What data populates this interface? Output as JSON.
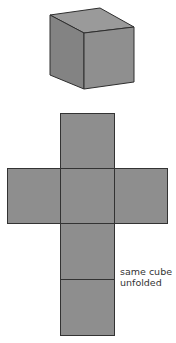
{
  "diagram": {
    "cube": {
      "label": "cube",
      "face_color": "#8e8e8e",
      "top_color": "#9a9a9a",
      "side_color": "#838383",
      "edge_color": "#2e2e2e"
    },
    "net": {
      "label": "cube net",
      "faces": [
        "top",
        "left",
        "front",
        "right",
        "bottom",
        "back"
      ],
      "face_color": "#8e8e8e",
      "edge_color": "#333333"
    },
    "caption": {
      "line1": "same cube",
      "line2": "unfolded"
    }
  }
}
